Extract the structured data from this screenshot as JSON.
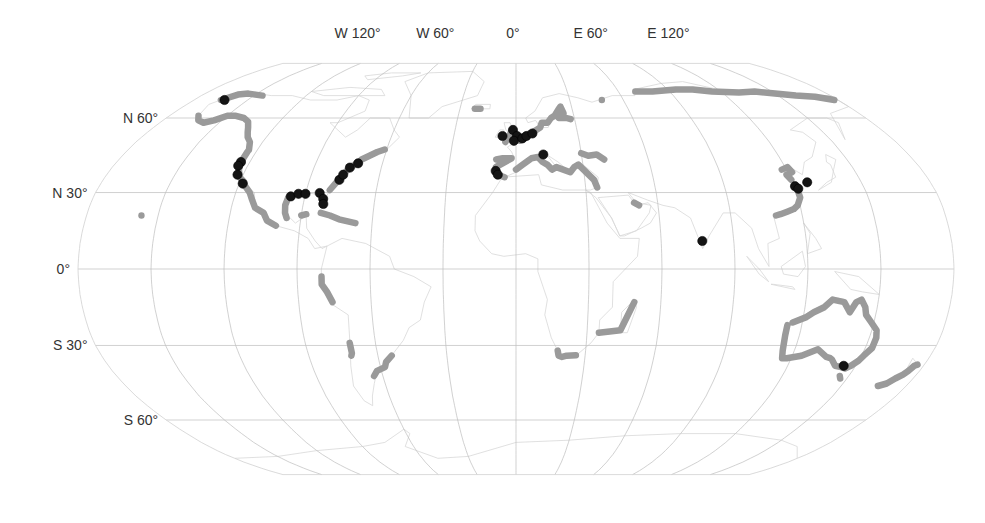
{
  "map": {
    "projection": "Robinson",
    "colors": {
      "background": "#ffffff",
      "graticule": "#bdbdbd",
      "land_outline": "#d8d8d8",
      "coast_segments": "#9a9a9a",
      "markers": "#141414"
    },
    "longitude_labels": [
      {
        "label": "W 120°",
        "lon": -120
      },
      {
        "label": "W 60°",
        "lon": -60
      },
      {
        "label": "0°",
        "lon": 0
      },
      {
        "label": "E 60°",
        "lon": 60
      },
      {
        "label": "E 120°",
        "lon": 120
      }
    ],
    "latitude_labels": [
      {
        "label": "N 60°",
        "lat": 60
      },
      {
        "label": "N 30°",
        "lat": 30
      },
      {
        "label": "0°",
        "lat": 0
      },
      {
        "label": "S 30°",
        "lat": -30
      },
      {
        "label": "S 60°",
        "lat": -60
      }
    ],
    "coast_segments_gray": [
      {
        "name": "Alaska north coast",
        "points": [
          [
            -165,
            68
          ],
          [
            -160,
            70.5
          ],
          [
            -155,
            71
          ],
          [
            -150,
            70.5
          ],
          [
            -145,
            70
          ]
        ]
      },
      {
        "name": "Alaska south / Gulf of Alaska",
        "points": [
          [
            -165,
            61
          ],
          [
            -162,
            59
          ],
          [
            -158,
            58
          ],
          [
            -154,
            59
          ],
          [
            -150,
            61
          ],
          [
            -146,
            61
          ],
          [
            -140,
            60
          ],
          [
            -136,
            58.5
          ],
          [
            -133,
            56
          ],
          [
            -131,
            54
          ],
          [
            -129,
            52
          ],
          [
            -126,
            50
          ],
          [
            -124,
            47
          ]
        ]
      },
      {
        "name": "US Pacific coast",
        "points": [
          [
            -124,
            46
          ],
          [
            -124,
            42
          ],
          [
            -123,
            39
          ],
          [
            -121,
            36
          ],
          [
            -118,
            34
          ],
          [
            -117,
            32.5
          ],
          [
            -114,
            30
          ],
          [
            -112,
            27
          ],
          [
            -110,
            24
          ],
          [
            -106,
            22
          ],
          [
            -104,
            19
          ],
          [
            -100,
            17
          ]
        ]
      },
      {
        "name": "Gulf of Mexico west",
        "points": [
          [
            -97,
            28
          ],
          [
            -97.5,
            25
          ],
          [
            -97,
            22
          ],
          [
            -96,
            20
          ]
        ]
      },
      {
        "name": "US Atlantic coast",
        "points": [
          [
            -80,
            31
          ],
          [
            -78,
            34
          ],
          [
            -76,
            37
          ],
          [
            -74,
            40
          ],
          [
            -71,
            41.5
          ],
          [
            -70,
            43
          ],
          [
            -67,
            44.5
          ],
          [
            -64,
            46
          ],
          [
            -61,
            47
          ]
        ]
      },
      {
        "name": "Caribbean",
        "points": [
          [
            -82,
            22
          ],
          [
            -78,
            21
          ],
          [
            -74,
            19.5
          ],
          [
            -67,
            18
          ]
        ]
      },
      {
        "name": "Yucatan",
        "points": [
          [
            -90,
            21
          ],
          [
            -88,
            21.5
          ]
        ]
      },
      {
        "name": "Hawaii",
        "points": [
          [
            -157,
            21
          ]
        ]
      },
      {
        "name": "Peru / Ecuador",
        "points": [
          [
            -80,
            -3
          ],
          [
            -80,
            -6
          ],
          [
            -78,
            -9
          ],
          [
            -76,
            -13
          ]
        ]
      },
      {
        "name": "Chile",
        "points": [
          [
            -71,
            -29
          ],
          [
            -71,
            -33
          ],
          [
            -71.5,
            -34
          ]
        ]
      },
      {
        "name": "Argentina / Uruguay",
        "points": [
          [
            -54,
            -34
          ],
          [
            -57,
            -36.5
          ],
          [
            -58,
            -38.5
          ],
          [
            -62,
            -40
          ],
          [
            -64,
            -42
          ]
        ]
      },
      {
        "name": "Iceland",
        "points": [
          [
            -22,
            64
          ],
          [
            -19,
            64
          ]
        ]
      },
      {
        "name": "British Isles / N France",
        "points": [
          [
            -5,
            50
          ],
          [
            -3,
            53
          ],
          [
            -2,
            55
          ],
          [
            0,
            51
          ],
          [
            2,
            50.5
          ],
          [
            4,
            51.5
          ]
        ]
      },
      {
        "name": "North Sea / Baltic",
        "points": [
          [
            5,
            53
          ],
          [
            8,
            54
          ],
          [
            10,
            55
          ],
          [
            12,
            56
          ],
          [
            13,
            58
          ],
          [
            16,
            58
          ],
          [
            18,
            60
          ],
          [
            20,
            61
          ],
          [
            22,
            63
          ],
          [
            24,
            65
          ],
          [
            25,
            62
          ],
          [
            22,
            60
          ],
          [
            26,
            60
          ],
          [
            28,
            59.5
          ]
        ]
      },
      {
        "name": "Iberia",
        "points": [
          [
            -9,
            43
          ],
          [
            -6,
            43.5
          ],
          [
            -2,
            43.5
          ],
          [
            -9,
            40
          ],
          [
            -8,
            37
          ],
          [
            -5,
            36
          ]
        ]
      },
      {
        "name": "Mediterranean",
        "points": [
          [
            0,
            39
          ],
          [
            3,
            41
          ],
          [
            7,
            43.5
          ],
          [
            10,
            44
          ],
          [
            12,
            42
          ],
          [
            14,
            41
          ],
          [
            16,
            39
          ],
          [
            18,
            40
          ],
          [
            24,
            38
          ],
          [
            26,
            40
          ],
          [
            28,
            41
          ],
          [
            34,
            35
          ],
          [
            35,
            32
          ]
        ]
      },
      {
        "name": "Black Sea",
        "points": [
          [
            30,
            45.5
          ],
          [
            33,
            44.5
          ],
          [
            37,
            45
          ],
          [
            40,
            43
          ]
        ]
      },
      {
        "name": "Persian Gulf",
        "points": [
          [
            50,
            26
          ],
          [
            52,
            25
          ]
        ]
      },
      {
        "name": "Siberian Arctic coast",
        "points": [
          [
            70,
            72
          ],
          [
            80,
            72
          ],
          [
            95,
            73
          ],
          [
            105,
            73
          ],
          [
            115,
            72
          ],
          [
            130,
            71.5
          ],
          [
            140,
            72
          ],
          [
            150,
            71
          ],
          [
            160,
            70
          ],
          [
            170,
            69.5
          ],
          [
            178,
            68
          ]
        ]
      },
      {
        "name": "Norway north",
        "points": [
          [
            48,
            68
          ]
        ]
      },
      {
        "name": "China / Bohai",
        "points": [
          [
            118,
            39
          ],
          [
            121,
            40
          ],
          [
            122,
            38
          ],
          [
            119,
            37
          ],
          [
            120,
            35
          ]
        ]
      },
      {
        "name": "China south coast",
        "points": [
          [
            121,
            31
          ],
          [
            121,
            28
          ],
          [
            119,
            25
          ],
          [
            117,
            23.5
          ],
          [
            114,
            22.5
          ],
          [
            111,
            21.5
          ],
          [
            109,
            21
          ]
        ]
      },
      {
        "name": "Madagascar / Mozambique",
        "points": [
          [
            49,
            -13
          ],
          [
            44,
            -24
          ],
          [
            35,
            -25
          ]
        ]
      },
      {
        "name": "South Africa",
        "points": [
          [
            18,
            -32
          ],
          [
            18.5,
            -34
          ],
          [
            20,
            -34.5
          ],
          [
            22,
            -34
          ],
          [
            26,
            -33.8
          ]
        ]
      },
      {
        "name": "Australia",
        "points": [
          [
            114,
            -22
          ],
          [
            114,
            -26
          ],
          [
            115,
            -32
          ],
          [
            116,
            -35
          ],
          [
            118,
            -35
          ],
          [
            124,
            -34
          ],
          [
            130,
            -31.5
          ],
          [
            135,
            -34.5
          ],
          [
            137,
            -35
          ],
          [
            138,
            -35.5
          ],
          [
            141,
            -38
          ],
          [
            144,
            -38.5
          ],
          [
            146,
            -39
          ],
          [
            148,
            -38
          ],
          [
            150,
            -36
          ],
          [
            151,
            -34
          ],
          [
            153,
            -31
          ],
          [
            153,
            -27
          ],
          [
            152,
            -24
          ],
          [
            149,
            -21
          ],
          [
            146,
            -18
          ],
          [
            145,
            -15
          ],
          [
            143,
            -12
          ],
          [
            141,
            -13
          ],
          [
            139,
            -17
          ],
          [
            136,
            -13
          ],
          [
            131,
            -12
          ],
          [
            128,
            -15
          ],
          [
            124,
            -17
          ],
          [
            121,
            -19
          ],
          [
            116,
            -21
          ]
        ]
      },
      {
        "name": "Tasmania",
        "points": [
          [
            146,
            -42
          ],
          [
            147,
            -43
          ]
        ]
      },
      {
        "name": "New Zealand",
        "points": [
          [
            167,
            -46
          ],
          [
            170,
            -45
          ],
          [
            172,
            -43
          ],
          [
            174,
            -41.5
          ],
          [
            175,
            -40
          ],
          [
            176,
            -38
          ],
          [
            177,
            -37.5
          ]
        ]
      }
    ],
    "markers_black": [
      {
        "name": "Alaska north",
        "lon": -163,
        "lat": 68
      },
      {
        "name": "California north",
        "lon": -124,
        "lat": 42
      },
      {
        "name": "California north 2",
        "lon": -124.2,
        "lat": 40.5
      },
      {
        "name": "California central",
        "lon": -122.5,
        "lat": 37
      },
      {
        "name": "California south",
        "lon": -118.5,
        "lat": 33.5
      },
      {
        "name": "Texas",
        "lon": -96,
        "lat": 28.5
      },
      {
        "name": "Louisiana",
        "lon": -93,
        "lat": 29.5
      },
      {
        "name": "Louisiana 2",
        "lon": -90,
        "lat": 29.5
      },
      {
        "name": "Florida west",
        "lon": -84,
        "lat": 29.8
      },
      {
        "name": "Florida",
        "lon": -82,
        "lat": 27.5
      },
      {
        "name": "Florida south",
        "lon": -81.5,
        "lat": 25.5
      },
      {
        "name": "Carolina",
        "lon": -77,
        "lat": 35
      },
      {
        "name": "Virginia",
        "lon": -76,
        "lat": 37
      },
      {
        "name": "New Jersey",
        "lon": -74,
        "lat": 39.8
      },
      {
        "name": "New England",
        "lon": -71,
        "lat": 41.5
      },
      {
        "name": "Ireland",
        "lon": -6.5,
        "lat": 52.5
      },
      {
        "name": "UK north",
        "lon": -1.5,
        "lat": 55
      },
      {
        "name": "UK east",
        "lon": 0.5,
        "lat": 52.5
      },
      {
        "name": "English Channel",
        "lon": -1,
        "lat": 50.5
      },
      {
        "name": "Benelux",
        "lon": 3,
        "lat": 51.5
      },
      {
        "name": "Netherlands",
        "lon": 5,
        "lat": 52.5
      },
      {
        "name": "Denmark/Germany",
        "lon": 8,
        "lat": 53.5
      },
      {
        "name": "Adriatic",
        "lon": 12.5,
        "lat": 45
      },
      {
        "name": "Portugal",
        "lon": -9,
        "lat": 38.5
      },
      {
        "name": "Gibraltar",
        "lon": -8,
        "lat": 37
      },
      {
        "name": "India south",
        "lon": 77,
        "lat": 11
      },
      {
        "name": "China east",
        "lon": 120.5,
        "lat": 32.5
      },
      {
        "name": "Shanghai",
        "lon": 121.5,
        "lat": 31.5
      },
      {
        "name": "Korea",
        "lon": 126.5,
        "lat": 34
      },
      {
        "name": "Melbourne",
        "lon": 144.8,
        "lat": -38
      }
    ]
  }
}
